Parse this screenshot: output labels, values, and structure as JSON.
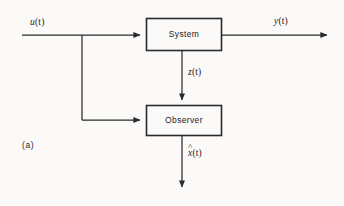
{
  "figure": {
    "caption": "(a)",
    "background_color": "#fbfaf8",
    "line_color": "#2a2a2a",
    "text_color": "#1b1b1b"
  },
  "blocks": [
    {
      "id": "system",
      "label": "System",
      "x": 146,
      "y": 18,
      "width": 76,
      "height": 33
    },
    {
      "id": "observer",
      "label": "Observer",
      "x": 146,
      "y": 105,
      "width": 76,
      "height": 31
    }
  ],
  "signals": [
    {
      "id": "input",
      "label": "u(t)",
      "base": "u",
      "arg": "(t)",
      "hat": false,
      "from": "external",
      "to": "system",
      "orientation": "horizontal"
    },
    {
      "id": "output",
      "label": "y(t)",
      "base": "y",
      "arg": "(t)",
      "hat": false,
      "from": "system",
      "to": "external",
      "orientation": "horizontal"
    },
    {
      "id": "measurement",
      "label": "z(t)",
      "base": "z",
      "arg": "(t)",
      "hat": false,
      "from": "system",
      "to": "observer",
      "orientation": "vertical"
    },
    {
      "id": "estimate",
      "label": "x̂(t)",
      "base": "x",
      "arg": "(t)",
      "hat": true,
      "from": "observer",
      "to": "external",
      "orientation": "vertical"
    }
  ],
  "junction": {
    "id": "input-branch",
    "x": 82,
    "y": 35,
    "drop_to_y": 120,
    "note": "u(t) branches to Observer"
  }
}
